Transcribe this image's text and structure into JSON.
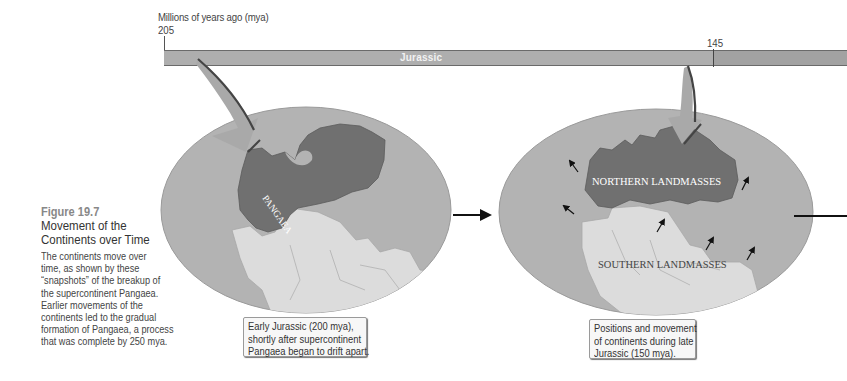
{
  "timeline": {
    "axis_label": "Millions of years ago (mya)",
    "tick_start": "205",
    "tick_mid": "145",
    "period_label": "Jurassic"
  },
  "figure": {
    "number": "Figure 19.7",
    "title_line1": "Movement of the",
    "title_line2": "Continents over Time",
    "body_lines": [
      "The continents move over",
      "time, as shown by these",
      "“snapshots” of the breakup of",
      "the supercontinent Pangaea.",
      "Earlier movements of the",
      "continents led to the gradual",
      "formation of Pangaea, a process",
      "that was complete by 250 mya."
    ]
  },
  "maps": [
    {
      "labels": [
        "PANGAEA"
      ],
      "caption_lines": [
        "Early Jurassic (200 mya),",
        "shortly after supercontinent",
        "Pangaea began to drift apart."
      ]
    },
    {
      "labels": [
        "NORTHERN LANDMASSES",
        "SOUTHERN LANDMASSES"
      ],
      "caption_lines": [
        "Positions and movement",
        "of continents during late",
        "Jurassic (150 mya)."
      ]
    }
  ],
  "colors": {
    "ocean": "#b3b3b3",
    "northern_land": "#707070",
    "southern_land": "#dcdcdc",
    "timeline_bar": "#aeaeae",
    "arrow_fill": "#a9a9a9",
    "arrow_edge": "#555555"
  }
}
